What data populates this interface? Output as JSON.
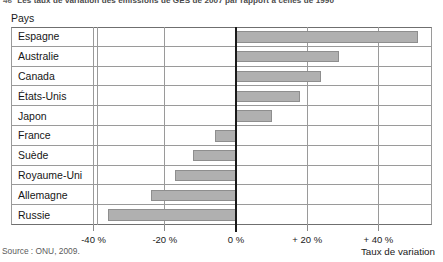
{
  "figure": {
    "number": "46",
    "title": "Les taux de variation des émissions de GES de 2007 par rapport à celles de 1990",
    "column_header": "Pays",
    "source": "Source : ONU, 2009.",
    "axis_title": "Taux de variation",
    "bar_color": "#b0b0b0",
    "bar_border_color": "#8e8e8e",
    "zero_line_color": "#1a1a1a",
    "grid_color": "#9a9a9a"
  },
  "chart_data": {
    "type": "bar",
    "orientation": "horizontal",
    "title": "Les taux de variation des émissions de GES de 2007 par rapport à celles de 1990",
    "xlabel": "Taux de variation",
    "ylabel": "Pays",
    "xlim": [
      -46,
      54
    ],
    "xticks": [
      -40,
      -20,
      0,
      20,
      40
    ],
    "xticklabels": [
      "-40 %",
      "-20 %",
      "0 %",
      "+ 20 %",
      "+ 40 %"
    ],
    "grid": true,
    "legend": "none",
    "unit": "%",
    "categories": [
      "Espagne",
      "Australie",
      "Canada",
      "États-Unis",
      "Japon",
      "France",
      "Suède",
      "Royaume-Uni",
      "Allemagne",
      "Russie"
    ],
    "values": [
      51,
      29,
      24,
      18,
      10,
      -6,
      -12,
      -17,
      -24,
      -36
    ]
  }
}
